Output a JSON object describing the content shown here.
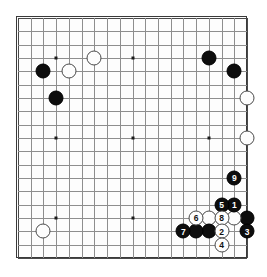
{
  "app": {
    "title": "Go Board Diagram",
    "board_size": 19,
    "colors": {
      "background": "#ffffff",
      "board": "#fdfdfd",
      "grid_line": "#8e8e8e",
      "border": "#3a3a3a",
      "black_stone": "#0d0d0d",
      "white_stone": "#fdfdfd",
      "black_label": "#ffffff",
      "white_label": "#111111"
    }
  },
  "board": {
    "size": 19,
    "star_points": [
      {
        "col": 4,
        "row": 4
      },
      {
        "col": 10,
        "row": 4
      },
      {
        "col": 16,
        "row": 4
      },
      {
        "col": 4,
        "row": 10
      },
      {
        "col": 10,
        "row": 10
      },
      {
        "col": 16,
        "row": 10
      },
      {
        "col": 4,
        "row": 16
      },
      {
        "col": 10,
        "row": 16
      },
      {
        "col": 16,
        "row": 16
      }
    ],
    "stones": [
      {
        "col": 3,
        "row": 5,
        "color": "black",
        "label": ""
      },
      {
        "col": 4,
        "row": 7,
        "color": "black",
        "label": ""
      },
      {
        "col": 5,
        "row": 5,
        "color": "white",
        "label": ""
      },
      {
        "col": 7,
        "row": 4,
        "color": "white",
        "label": ""
      },
      {
        "col": 16,
        "row": 4,
        "color": "black",
        "label": ""
      },
      {
        "col": 18,
        "row": 5,
        "color": "black",
        "label": ""
      },
      {
        "col": 19,
        "row": 7,
        "color": "white",
        "label": ""
      },
      {
        "col": 19,
        "row": 10,
        "color": "white",
        "label": ""
      },
      {
        "col": 3,
        "row": 17,
        "color": "white",
        "label": ""
      },
      {
        "col": 18,
        "row": 13,
        "color": "black",
        "label": "9"
      },
      {
        "col": 18,
        "row": 15,
        "color": "black",
        "label": "1"
      },
      {
        "col": 17,
        "row": 15,
        "color": "black",
        "label": "5"
      },
      {
        "col": 19,
        "row": 16,
        "color": "black",
        "label": ""
      },
      {
        "col": 17,
        "row": 16,
        "color": "white",
        "label": "8"
      },
      {
        "col": 18,
        "row": 16,
        "color": "white",
        "label": ""
      },
      {
        "col": 16,
        "row": 16,
        "color": "white",
        "label": ""
      },
      {
        "col": 15,
        "row": 16,
        "color": "white",
        "label": "6"
      },
      {
        "col": 19,
        "row": 17,
        "color": "black",
        "label": "3"
      },
      {
        "col": 17,
        "row": 17,
        "color": "white",
        "label": "2"
      },
      {
        "col": 16,
        "row": 17,
        "color": "black",
        "label": ""
      },
      {
        "col": 15,
        "row": 17,
        "color": "black",
        "label": ""
      },
      {
        "col": 14,
        "row": 17,
        "color": "black",
        "label": "7"
      },
      {
        "col": 17,
        "row": 18,
        "color": "white",
        "label": "4"
      }
    ],
    "move_sequence": [
      "1",
      "2",
      "3",
      "4",
      "5",
      "6",
      "7",
      "8",
      "9"
    ]
  }
}
